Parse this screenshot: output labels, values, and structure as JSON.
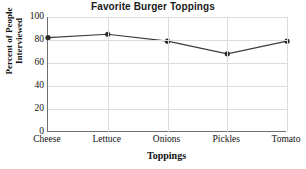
{
  "chart_data": {
    "type": "line",
    "title": "Favorite Burger Toppings",
    "xlabel": "Toppings",
    "ylabel": "Percent of People Interviewed",
    "ylabel_lines": [
      "Percent of People",
      "Interviewed"
    ],
    "categories": [
      "Cheese",
      "Lettuce",
      "Onions",
      "Pickles",
      "Tomato"
    ],
    "values": [
      82,
      85,
      79,
      68,
      79
    ],
    "ylim": [
      0,
      100
    ],
    "yticks": [
      0,
      20,
      40,
      60,
      80,
      100
    ],
    "ytick_labels": [
      "0",
      "20",
      "40",
      "60",
      "80",
      "100"
    ],
    "grid": true,
    "legend": "none",
    "series_color": "#3b3b3b",
    "marker": "circle",
    "marker_color": "#2b2b2b",
    "grid_color": "#dcdcdc",
    "axis_color": "#6f6f6f",
    "background": "#ffffff"
  }
}
